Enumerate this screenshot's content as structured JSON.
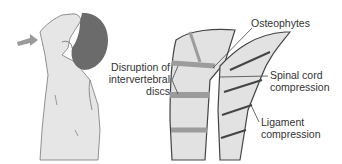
{
  "figure": {
    "labels": {
      "osteophytes": "Osteophytes",
      "disc_disruption_line1": "Disruption of",
      "disc_disruption_line2": "intervertebral",
      "disc_disruption_line3": "discs",
      "spinal_cord_line1": "Spinal cord",
      "spinal_cord_line2": "compression",
      "ligament_line1": "Ligament",
      "ligament_line2": "compression"
    },
    "colors": {
      "skin": "#e6e6e6",
      "hair": "#6b6b6b",
      "arrow": "#9a9a9a",
      "vertebra": "#e2e2e2",
      "disc": "#9c9c9c",
      "outline": "#444444"
    }
  }
}
